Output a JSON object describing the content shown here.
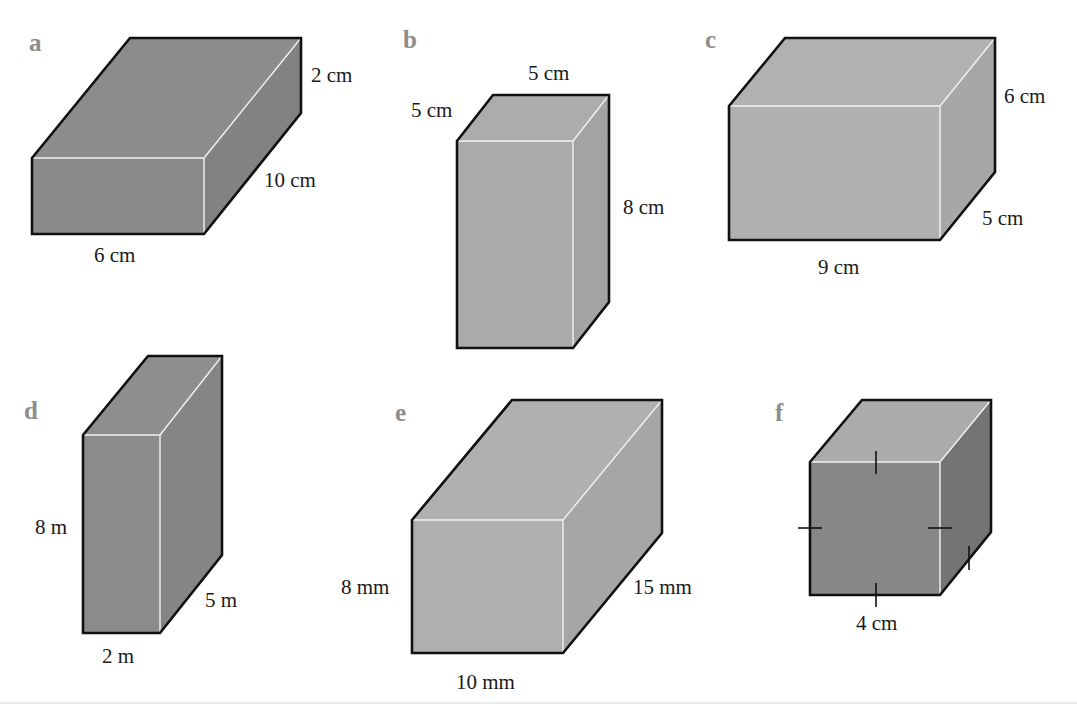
{
  "figure": {
    "type": "cuboid-exercise",
    "colors": {
      "dark_face": "#8a8a8a",
      "dark_side": "#7e7e7e",
      "light_face": "#b0b0b0",
      "light_side": "#a5a5a5",
      "cube_top": "#ababab",
      "cube_front": "#8a8a8a",
      "cube_side": "#777777",
      "outline": "#111111",
      "hidden_edge_highlight": "#f2f2f2",
      "letter": "#8c8c8c",
      "text": "#1a1a1a"
    },
    "shapes": [
      {
        "id": "a",
        "letter": "a",
        "shade": "dark",
        "labels": {
          "height": "2 cm",
          "depth": "10 cm",
          "width": "6 cm"
        }
      },
      {
        "id": "b",
        "letter": "b",
        "shade": "light",
        "labels": {
          "top_width": "5 cm",
          "top_depth": "5 cm",
          "height": "8 cm"
        }
      },
      {
        "id": "c",
        "letter": "c",
        "shade": "light",
        "labels": {
          "height": "6 cm",
          "depth": "5 cm",
          "width": "9 cm"
        }
      },
      {
        "id": "d",
        "letter": "d",
        "shade": "dark",
        "labels": {
          "height": "8 m",
          "depth": "5 m",
          "width": "2 m"
        }
      },
      {
        "id": "e",
        "letter": "e",
        "shade": "light",
        "labels": {
          "height": "8 mm",
          "depth": "15 mm",
          "width": "10 mm"
        }
      },
      {
        "id": "f",
        "letter": "f",
        "shade": "cube",
        "equal_edge_marks": true,
        "labels": {
          "width": "4 cm"
        }
      }
    ]
  }
}
